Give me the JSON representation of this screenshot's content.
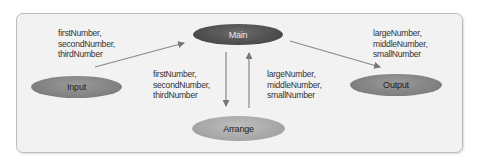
{
  "diagram": {
    "type": "data-flow",
    "nodes": [
      {
        "id": "main",
        "label": "Main"
      },
      {
        "id": "input",
        "label": "Input"
      },
      {
        "id": "output",
        "label": "Output"
      },
      {
        "id": "arrange",
        "label": "Arrange"
      }
    ],
    "edges": [
      {
        "from": "input",
        "to": "main",
        "label_lines": [
          "firstNumber,",
          "secondNumber,",
          "thirdNumber"
        ]
      },
      {
        "from": "main",
        "to": "arrange",
        "label_lines": [
          "firstNumber,",
          "secondNumber,",
          "thirdNumber"
        ]
      },
      {
        "from": "arrange",
        "to": "main",
        "label_lines": [
          "largeNumber,",
          "middleNumber,",
          "smallNumber"
        ]
      },
      {
        "from": "main",
        "to": "output",
        "label_lines": [
          "largeNumber,",
          "middleNumber,",
          "smallNumber"
        ]
      }
    ]
  },
  "colors": {
    "panel_bg": "#f2f2f2",
    "panel_border": "#bdbdbd",
    "main_node": "#4a4a4a",
    "io_node": "#7e7e7e",
    "arrange_node": "#a4a4a4",
    "arrow": "#777777"
  }
}
